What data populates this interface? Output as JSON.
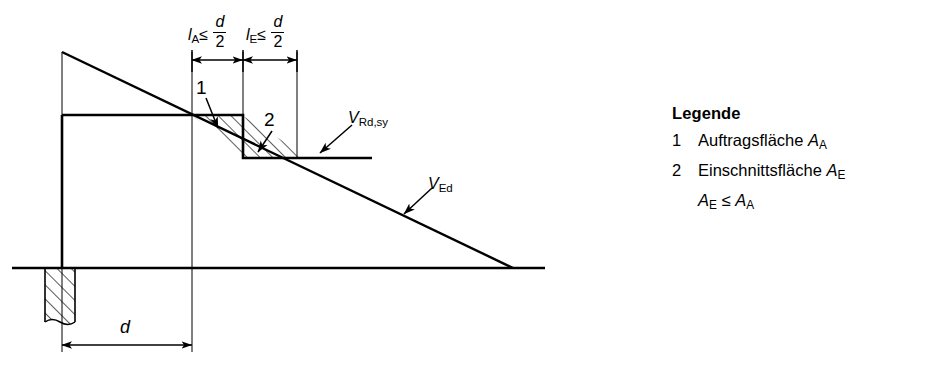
{
  "figure": {
    "dimensions": {
      "span_a": {
        "symbol": "l",
        "subscript": "A",
        "relation": "≤",
        "fraction_num": "d",
        "fraction_den": "2"
      },
      "span_e": {
        "symbol": "l",
        "subscript": "E",
        "relation": "≤",
        "fraction_num": "d",
        "fraction_den": "2"
      },
      "depth": {
        "label": "d"
      }
    },
    "curves": {
      "resistance": {
        "symbol": "V",
        "subscript": "Rd,sy"
      },
      "action": {
        "symbol": "V",
        "subscript": "Ed"
      }
    },
    "regions": [
      {
        "key": "1",
        "name": "Auftragsfläche"
      },
      {
        "key": "2",
        "name": "Einschnittsfläche"
      }
    ]
  },
  "legend": {
    "title": "Legende",
    "items": [
      {
        "key": "1",
        "text": "Auftragsfläche",
        "symbol": "A",
        "subscript": "A"
      },
      {
        "key": "2",
        "text": "Einschnittsfläche",
        "symbol": "A",
        "subscript": "E"
      }
    ],
    "note": {
      "left_symbol": "A",
      "left_sub": "E",
      "relation": "≤",
      "right_symbol": "A",
      "right_sub": "A"
    }
  },
  "colors": {
    "ink": "#000000",
    "background": "#ffffff"
  }
}
